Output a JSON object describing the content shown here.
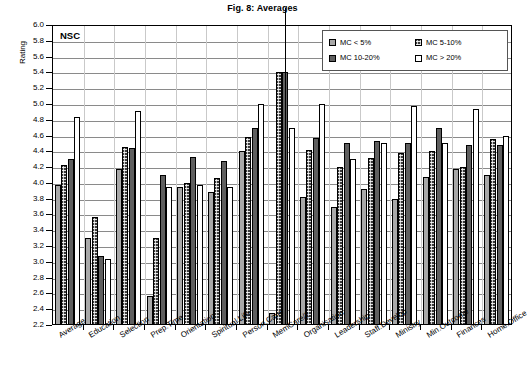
{
  "chart_data": {
    "type": "bar",
    "title": "Fig. 8: Averages",
    "annotation": "NSC",
    "xlabel": "",
    "ylabel": "Rating",
    "ylim": [
      2.2,
      6.0
    ],
    "ytick_step": 0.2,
    "grid": true,
    "legend_position": "top-right",
    "ytick_labels": [
      "6.0",
      "5.8",
      "5.6",
      "5.4",
      "5.2",
      "5.0",
      "4.8",
      "4.6",
      "4.4",
      "4.2",
      "4.0",
      "3.8",
      "3.6",
      "3.4",
      "3.2",
      "3.0",
      "2.8",
      "2.6",
      "2.4",
      "2.2"
    ],
    "categories": [
      "Average",
      "Education",
      "Selection",
      "Prep.Time",
      "Orientation",
      "Spiritual.Life",
      "Person.Care",
      "MemCare/2",
      "Organisation",
      "Leadership",
      "Staff.Develop",
      "Ministry",
      "Min.Outcome",
      "Finances",
      "Home.Office"
    ],
    "series": [
      {
        "name": "MC < 5%",
        "color": "#a8a8a8",
        "values": [
          3.97,
          3.3,
          4.17,
          2.57,
          3.95,
          3.88,
          4.41,
          2.35,
          3.82,
          3.7,
          3.92,
          3.8,
          4.07,
          4.18,
          4.1
        ]
      },
      {
        "name": "MC  5-10%",
        "color": "#3a3a3a",
        "values": [
          4.23,
          3.57,
          4.45,
          3.3,
          4.0,
          4.06,
          4.58,
          5.41,
          4.42,
          4.2,
          4.32,
          4.38,
          4.4,
          4.2,
          4.55
        ]
      },
      {
        "name": "MC 10-20%",
        "color": "#5f5f5f",
        "values": [
          4.3,
          3.07,
          4.44,
          4.1,
          4.33,
          4.28,
          4.7,
          5.41,
          4.57,
          4.5,
          4.53,
          4.5,
          4.7,
          4.48,
          4.48
        ]
      },
      {
        "name": "MC > 20%",
        "color": "#ffffff",
        "values": [
          4.83,
          3.03,
          4.91,
          3.95,
          3.97,
          3.95,
          5.0,
          4.7,
          5.0,
          4.3,
          4.5,
          4.98,
          4.5,
          4.93,
          4.6
        ]
      }
    ]
  }
}
